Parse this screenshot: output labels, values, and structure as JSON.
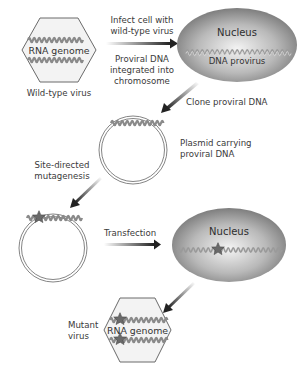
{
  "diagram": {
    "wild_type_virus": {
      "genome_label": "RNA genome",
      "caption": "Wild-type virus"
    },
    "step_infect": {
      "label_above": [
        "Infect cell with",
        "wild-type virus"
      ],
      "label_below": [
        "Proviral DNA",
        "integrated into",
        "chromosome"
      ]
    },
    "nucleus_1": {
      "title": "Nucleus",
      "dna_label": "DNA provirus"
    },
    "step_clone": {
      "label": "Clone proviral DNA"
    },
    "plasmid_1": {
      "caption": [
        "Plasmid carrying",
        "proviral DNA"
      ]
    },
    "step_mutagenesis": {
      "label": [
        "Site-directed",
        "mutagenesis"
      ]
    },
    "step_transfection": {
      "label": "Transfection"
    },
    "nucleus_2": {
      "title": "Nucleus"
    },
    "mutant_virus": {
      "genome_label": "RNA genome",
      "caption": [
        "Mutant",
        "virus"
      ]
    },
    "colors": {
      "nucleus_fill_center": "#f2f2f2",
      "nucleus_fill_edge": "#7a7a7a",
      "capsid_fill": "#f3f3f3",
      "capsid_stroke": "#666666",
      "strand": "#8a8a8a",
      "mutation_star": "#6e6e6e",
      "arrow": "#333333",
      "text": "#3a3a3a"
    }
  }
}
